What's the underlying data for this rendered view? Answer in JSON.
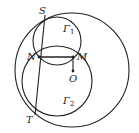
{
  "diagram": {
    "type": "geometry",
    "stroke_color": "#222222",
    "background": "#ffffff",
    "points": {
      "S": {
        "label": "S",
        "x": 45,
        "y": 15
      },
      "N": {
        "label": "N",
        "x": 39,
        "y": 57
      },
      "M": {
        "label": "M",
        "x": 73,
        "y": 57
      },
      "O": {
        "label": "O",
        "x": 73,
        "y": 71
      },
      "T": {
        "label": "T",
        "x": 35,
        "y": 115
      }
    },
    "circles": {
      "big": {
        "name": "O",
        "cx": 72,
        "cy": 70,
        "r": 57
      },
      "gamma1": {
        "label": "Γ",
        "sub": "1",
        "cx": 57,
        "cy": 41,
        "r": 24
      },
      "gamma2": {
        "label": "Γ",
        "sub": "2",
        "cx": 57,
        "cy": 81,
        "r": 35
      }
    },
    "segments": [
      {
        "from": "S",
        "to": "T"
      },
      {
        "from": "N",
        "to": "M"
      },
      {
        "from": "M",
        "to": "O"
      }
    ]
  }
}
